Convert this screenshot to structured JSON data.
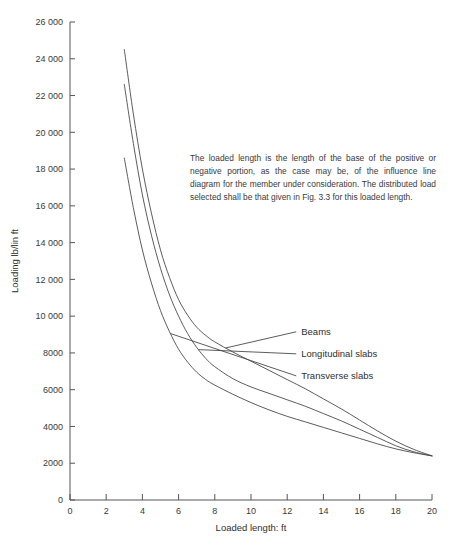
{
  "chart_data": {
    "type": "line",
    "title": "",
    "xlabel": "Loaded length: ft",
    "ylabel": "Loading lb/lin ft",
    "xlim": [
      0,
      20
    ],
    "ylim": [
      0,
      26000
    ],
    "grid": false,
    "legend_position": "inline-right-labels",
    "x_ticks": [
      0,
      2,
      4,
      6,
      8,
      10,
      12,
      14,
      16,
      18,
      20
    ],
    "x_tick_labels": [
      "0",
      "2",
      "4",
      "6",
      "8",
      "10",
      "12",
      "14",
      "16",
      "18",
      "20"
    ],
    "y_ticks": [
      0,
      2000,
      4000,
      6000,
      8000,
      10000,
      12000,
      14000,
      16000,
      18000,
      20000,
      22000,
      24000,
      26000
    ],
    "y_tick_labels": [
      "0",
      "2000",
      "4000",
      "6000",
      "8000",
      "10 000",
      "12 000",
      "14 000",
      "16 000",
      "18 000",
      "20 000",
      "22 000",
      "24 000",
      "26 000"
    ],
    "x": [
      3,
      3.5,
      4,
      4.5,
      5,
      5.5,
      6,
      6.5,
      7,
      7.5,
      8,
      9,
      10,
      11,
      12,
      13,
      14,
      15,
      16,
      17,
      18,
      19,
      20
    ],
    "series": [
      {
        "name": "Beams",
        "label": "Beams",
        "values": [
          24500,
          21000,
          18000,
          15600,
          13600,
          12100,
          10900,
          10050,
          9400,
          8950,
          8600,
          8050,
          7550,
          7050,
          6550,
          6050,
          5500,
          4950,
          4350,
          3750,
          3200,
          2750,
          2400
        ]
      },
      {
        "name": "Longitudinal slabs",
        "label": "Longitudinal slabs",
        "values": [
          22600,
          19400,
          16600,
          14400,
          12600,
          11150,
          10000,
          9050,
          8300,
          7700,
          7250,
          6600,
          6150,
          5800,
          5450,
          5100,
          4700,
          4300,
          3850,
          3400,
          2950,
          2620,
          2400
        ]
      },
      {
        "name": "Transverse slabs",
        "label": "Transverse slabs",
        "values": [
          18600,
          15900,
          13600,
          11800,
          10300,
          9150,
          8200,
          7500,
          6950,
          6550,
          6250,
          5750,
          5300,
          4900,
          4550,
          4250,
          3950,
          3650,
          3350,
          3050,
          2780,
          2570,
          2400
        ]
      }
    ],
    "annotation": "The loaded length is the length of the base of the positive or negative portion, as the case may be, of the influence line diagram for the member under consideration. The distributed load selected shall be that given in Fig. 3.3 for this loaded length.",
    "series_label_anchors": [
      {
        "name": "Beams",
        "curve_x": 8.6,
        "label_x": 12.5,
        "label_y_value": 9150
      },
      {
        "name": "Longitudinal slabs",
        "curve_x": 7.1,
        "label_x": 12.5,
        "label_y_value": 7950
      },
      {
        "name": "Transverse slabs",
        "curve_x": 5.55,
        "label_x": 12.5,
        "label_y_value": 6750
      }
    ],
    "colors": {
      "curve": "#4a4a4a",
      "axis": "#555555",
      "text": "#3a3a3a",
      "background": "#ffffff"
    }
  }
}
